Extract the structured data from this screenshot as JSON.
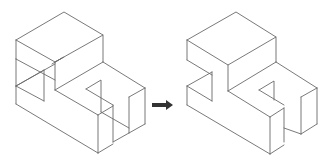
{
  "diagram": {
    "left_figure": {
      "label": "Wireframe isometric solid with all edges (including hidden)",
      "stroke_color": "#6a6a6a"
    },
    "arrow": {
      "label": "transforms into",
      "color": "#333333",
      "icon": "right-arrow-icon"
    },
    "right_figure": {
      "label": "Isometric solid with hidden edges removed",
      "stroke_color": "#6a6a6a"
    }
  }
}
